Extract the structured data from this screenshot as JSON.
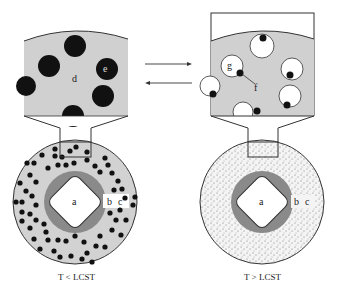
{
  "diagram": {
    "left_panel": {
      "caption": "T < LCST",
      "labels": {
        "a": "a",
        "b": "b",
        "c": "c",
        "d": "d",
        "e": "e"
      }
    },
    "right_panel": {
      "caption": "T > LCST",
      "labels": {
        "a": "a",
        "b": "b",
        "c": "c",
        "f": "f",
        "g": "g"
      }
    },
    "arrows": [
      "forward",
      "reverse"
    ],
    "colors": {
      "matrix_gray": "#d0d0d0",
      "shell_gray": "#8a8a8a",
      "particle": "#111111",
      "outline": "#333333"
    }
  }
}
